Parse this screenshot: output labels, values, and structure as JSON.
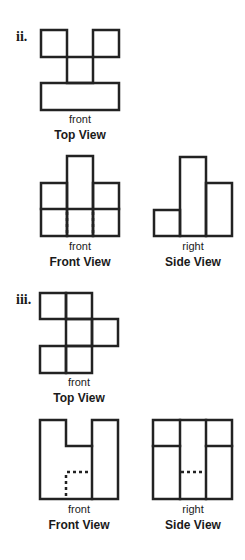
{
  "problems": [
    {
      "label": "ii.",
      "views": [
        {
          "name": "top",
          "direction_label": "front",
          "title": "Top View"
        },
        {
          "name": "front",
          "direction_label": "front",
          "title": "Front View"
        },
        {
          "name": "side",
          "direction_label": "right",
          "title": "Side View"
        }
      ]
    },
    {
      "label": "iii.",
      "views": [
        {
          "name": "top",
          "direction_label": "front",
          "title": "Top View"
        },
        {
          "name": "front",
          "direction_label": "front",
          "title": "Front View"
        },
        {
          "name": "side",
          "direction_label": "right",
          "title": "Side View"
        }
      ]
    }
  ],
  "colors": {
    "line": "#222222",
    "background": "#ffffff"
  }
}
